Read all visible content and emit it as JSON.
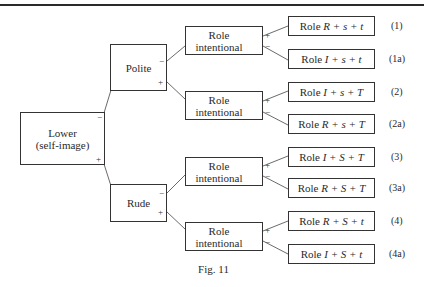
{
  "figure": {
    "caption": "Fig. 11",
    "root": {
      "line1": "Lower",
      "line2": "(self-image)",
      "minus": "−",
      "plus": "+"
    },
    "branches": [
      {
        "label": "Polite",
        "minus": "−",
        "plus": "+"
      },
      {
        "label": "Rude",
        "minus": "−",
        "plus": "+"
      }
    ],
    "role_boxes": [
      {
        "line1": "Role",
        "line2": "intentional",
        "plus": "+",
        "minus": "−"
      },
      {
        "line1": "Role",
        "line2": "intentional",
        "plus": "+",
        "minus": "−"
      },
      {
        "line1": "Role",
        "line2": "intentional",
        "plus": "+",
        "minus": "−"
      },
      {
        "line1": "Role",
        "line2": "intentional",
        "plus": "+",
        "minus": "−"
      }
    ],
    "leaves": [
      {
        "prefix": "Role ",
        "formula": "R + s + t",
        "label": "(1)"
      },
      {
        "prefix": "Role ",
        "formula": "I + s + t",
        "label": "(1a)"
      },
      {
        "prefix": "Role ",
        "formula": "I + s + T",
        "label": "(2)"
      },
      {
        "prefix": "Role ",
        "formula": "R + s + T",
        "label": "(2a)"
      },
      {
        "prefix": "Role ",
        "formula": "I + S + T",
        "label": "(3)"
      },
      {
        "prefix": "Role ",
        "formula": "R + S + T",
        "label": "(3a)"
      },
      {
        "prefix": "Role ",
        "formula": "R + S + t",
        "label": "(4)"
      },
      {
        "prefix": "Role ",
        "formula": "I + S + t",
        "label": "(4a)"
      }
    ]
  }
}
